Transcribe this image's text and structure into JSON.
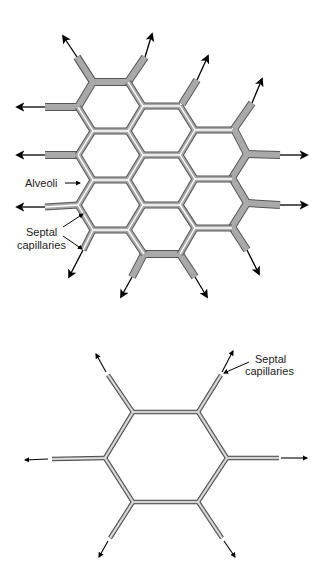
{
  "figure": {
    "top_panel": {
      "labels": {
        "alveoli": "Alveoli",
        "septal_line1": "Septal",
        "septal_line2": "capillaries"
      }
    },
    "bottom_panel": {
      "labels": {
        "septal_line1": "Septal",
        "septal_line2": "capillaries"
      }
    },
    "colors": {
      "wall_fill": "#a9a9a9",
      "wall_outline": "#555555",
      "arrow": "#000000",
      "background": "#ffffff"
    }
  }
}
